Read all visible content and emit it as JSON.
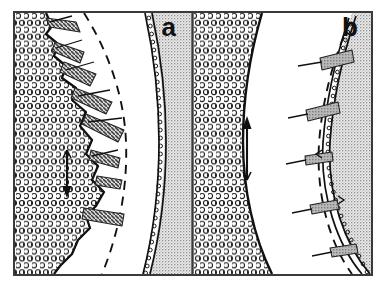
{
  "figure": {
    "kind": "scientific-line-drawing",
    "background_color": "#ffffff",
    "line_color": "#111111",
    "frame": {
      "x": 13,
      "y": 11,
      "width": 360,
      "height": 265,
      "stroke_color": "#3a3a3a",
      "stroke_width": 2,
      "divider_x": 192
    }
  },
  "panels": [
    {
      "id": "panel-a",
      "label": "a",
      "label_position": {
        "x": 176,
        "y": 35
      },
      "regions": [
        {
          "name": "circle-packed-region",
          "texture": "open-circles",
          "side": "left",
          "fill_color": "#ffffff",
          "circle_stroke": "#1a1a1a",
          "circle_radius": 2.6,
          "circle_spacing": 8
        },
        {
          "name": "clear-lumen-region",
          "texture": "blank",
          "fill_color": "#ffffff"
        },
        {
          "name": "stippled-region",
          "texture": "fine-stipple",
          "side": "right",
          "fill_color": "#e8e8e8",
          "dot_color": "#8a8a8a",
          "dot_spacing": 3
        }
      ],
      "curves": [
        {
          "name": "inner-boundary-irregular",
          "style": "solid",
          "stroke_width": 2.2
        },
        {
          "name": "dashed-guide-curve",
          "style": "dashed",
          "dash_pattern": "8 7",
          "stroke_width": 1.8
        },
        {
          "name": "beaded-chain-boundary",
          "style": "beaded",
          "bead_radius": 1.9
        }
      ],
      "wedges": [
        {
          "name": "hatched-wedge",
          "index": 1,
          "texture": "cross-hatch"
        },
        {
          "name": "hatched-wedge",
          "index": 2,
          "texture": "cross-hatch"
        },
        {
          "name": "hatched-wedge",
          "index": 3,
          "texture": "cross-hatch"
        },
        {
          "name": "hatched-wedge",
          "index": 4,
          "texture": "cross-hatch"
        },
        {
          "name": "hatched-wedge",
          "index": 5,
          "texture": "cross-hatch"
        },
        {
          "name": "hatched-wedge",
          "index": 6,
          "texture": "cross-hatch"
        },
        {
          "name": "hatched-wedge",
          "index": 7,
          "texture": "cross-hatch"
        },
        {
          "name": "hatched-wedge",
          "index": 8,
          "texture": "cross-hatch"
        }
      ],
      "arrow": {
        "name": "direction-arrow",
        "orientation": "downward",
        "x": 67,
        "y_start": 148,
        "y_end": 196
      }
    },
    {
      "id": "panel-b",
      "label": "b",
      "label_position": {
        "x": 356,
        "y": 35
      },
      "regions": [
        {
          "name": "circle-packed-region",
          "texture": "open-circles",
          "side": "left",
          "fill_color": "#ffffff",
          "circle_stroke": "#1a1a1a",
          "circle_radius": 2.6,
          "circle_spacing": 8
        },
        {
          "name": "clear-lumen-region",
          "texture": "blank",
          "fill_color": "#ffffff"
        },
        {
          "name": "stippled-region",
          "texture": "fine-stipple",
          "side": "right",
          "fill_color": "#e8e8e8",
          "dot_color": "#8a8a8a",
          "dot_spacing": 3
        }
      ],
      "curves": [
        {
          "name": "inner-boundary-smooth",
          "style": "solid",
          "stroke_width": 2.2
        },
        {
          "name": "dashed-guide-curve",
          "style": "dashed",
          "dash_pattern": "8 7",
          "stroke_width": 1.8
        },
        {
          "name": "beaded-chain-boundary",
          "style": "beaded",
          "bead_radius": 1.9
        }
      ],
      "wedges": [
        {
          "name": "hatched-wedge",
          "index": 1,
          "texture": "solid-grey"
        },
        {
          "name": "hatched-wedge",
          "index": 2,
          "texture": "solid-grey"
        },
        {
          "name": "hatched-wedge",
          "index": 3,
          "texture": "solid-grey"
        },
        {
          "name": "hatched-wedge",
          "index": 4,
          "texture": "solid-grey"
        },
        {
          "name": "hatched-wedge",
          "index": 5,
          "texture": "solid-grey"
        }
      ],
      "arrow": {
        "name": "direction-arrow",
        "orientation": "upward",
        "x": 247,
        "y_start": 180,
        "y_end": 118
      }
    }
  ]
}
